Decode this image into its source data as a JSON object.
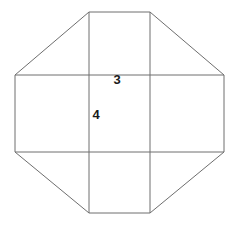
{
  "figure": {
    "name": "octagon-with-inscribed-grid",
    "background_color": "#ffffff",
    "stroke_color": "#6e6e6e",
    "stroke_width": 1,
    "width": 232,
    "height": 226,
    "octagon": {
      "name": "octagon-outline",
      "points": "89,12 150,12 224,75 224,152 150,213 89,213 15,152 15,75",
      "vertices": [
        {
          "name": "top-left-vertex",
          "x": 89,
          "y": 12
        },
        {
          "name": "top-right-vertex",
          "x": 150,
          "y": 12
        },
        {
          "name": "right-top-vertex",
          "x": 224,
          "y": 75
        },
        {
          "name": "right-bottom-vertex",
          "x": 224,
          "y": 152
        },
        {
          "name": "bottom-right-vertex",
          "x": 150,
          "y": 213
        },
        {
          "name": "bottom-left-vertex",
          "x": 89,
          "y": 213
        },
        {
          "name": "left-bottom-vertex",
          "x": 15,
          "y": 152
        },
        {
          "name": "left-top-vertex",
          "x": 15,
          "y": 75
        }
      ]
    },
    "grid_lines": [
      {
        "name": "vertical-line-left",
        "x1": 89,
        "y1": 12,
        "x2": 89,
        "y2": 213
      },
      {
        "name": "vertical-line-right",
        "x1": 150,
        "y1": 12,
        "x2": 150,
        "y2": 213
      },
      {
        "name": "horizontal-line-top",
        "x1": 15,
        "y1": 75,
        "x2": 224,
        "y2": 75
      },
      {
        "name": "horizontal-line-bottom",
        "x1": 15,
        "y1": 152,
        "x2": 224,
        "y2": 152
      }
    ],
    "labels": [
      {
        "name": "width-label",
        "text": "3",
        "x": 117,
        "y": 81
      },
      {
        "name": "height-label",
        "text": "4",
        "x": 96,
        "y": 116
      }
    ]
  },
  "chart_data": {
    "type": "diagram",
    "title": "",
    "shape": "octagon",
    "measurements": [
      {
        "label": "3",
        "meaning": "width of central rectangle",
        "value": 3
      },
      {
        "label": "4",
        "meaning": "height of central rectangle",
        "value": 4
      }
    ]
  }
}
